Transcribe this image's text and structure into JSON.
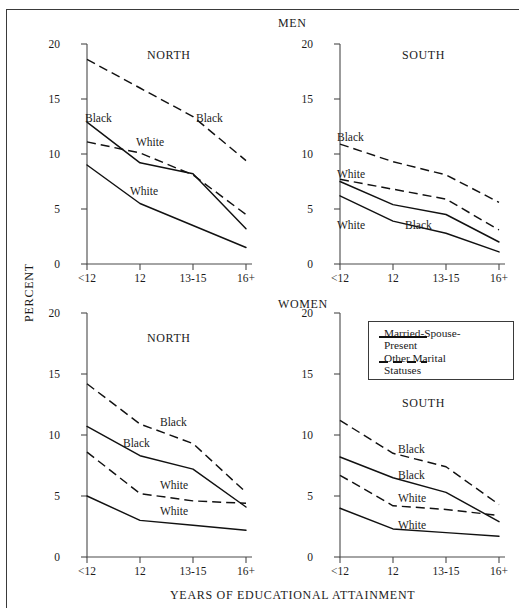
{
  "figure": {
    "xlabel": "YEARS OF EDUCATIONAL ATTAINMENT",
    "ylabel": "PERCENT",
    "group_men": "MEN",
    "group_women": "WOMEN"
  },
  "legend": {
    "title": "",
    "entries": [
      {
        "style": "solid",
        "line1": "Married-Spouse-",
        "line2": "Present"
      },
      {
        "style": "dashed",
        "line1": "Other Marital",
        "line2": "Statuses"
      }
    ]
  },
  "axes": {
    "y_ticks": [
      "0",
      "5",
      "10",
      "15",
      "20"
    ],
    "x_ticks": [
      "<12",
      "12",
      "13-15",
      "16+"
    ]
  },
  "panels": {
    "men_north": {
      "title": "NORTH",
      "labels": [
        "Black",
        "White",
        "Black",
        "White"
      ]
    },
    "men_south": {
      "title": "SOUTH",
      "labels": [
        "Black",
        "White",
        "White",
        "Black"
      ]
    },
    "women_north": {
      "title": "NORTH",
      "labels": [
        "Black",
        "Black",
        "White",
        "White"
      ]
    },
    "women_south": {
      "title": "SOUTH",
      "labels": [
        "Black",
        "Black",
        "White",
        "White"
      ]
    }
  },
  "chart_data": {
    "type": "line",
    "xlabel": "YEARS OF EDUCATIONAL ATTAINMENT",
    "ylabel": "PERCENT",
    "categories": [
      "<12",
      "12",
      "13-15",
      "16+"
    ],
    "ylim": [
      0,
      20
    ],
    "yticks": [
      0,
      5,
      10,
      15,
      20
    ],
    "grid": false,
    "legend_position": "inside-top-right-of-women-south-panel",
    "legend": [
      "Married-Spouse-Present",
      "Other Marital Statuses"
    ],
    "panels": [
      {
        "group": "MEN",
        "region": "NORTH",
        "series": [
          {
            "name": "Black, Other Marital Statuses",
            "race": "Black",
            "marital": "Other Marital Statuses",
            "style": "dashed",
            "values": [
              18.6,
              16.0,
              13.4,
              9.4
            ]
          },
          {
            "name": "Black, Married-Spouse-Present",
            "race": "Black",
            "marital": "Married-Spouse-Present",
            "style": "solid",
            "values": [
              12.9,
              9.2,
              8.2,
              3.2
            ]
          },
          {
            "name": "White, Other Marital Statuses",
            "race": "White",
            "marital": "Other Marital Statuses",
            "style": "dashed",
            "values": [
              11.1,
              10.1,
              8.1,
              4.5
            ]
          },
          {
            "name": "White, Married-Spouse-Present",
            "race": "White",
            "marital": "Married-Spouse-Present",
            "style": "solid",
            "values": [
              9.0,
              5.5,
              3.5,
              1.5
            ]
          }
        ]
      },
      {
        "group": "MEN",
        "region": "SOUTH",
        "series": [
          {
            "name": "Black, Other Marital Statuses",
            "race": "Black",
            "marital": "Other Marital Statuses",
            "style": "dashed",
            "values": [
              10.9,
              9.3,
              8.1,
              5.6
            ]
          },
          {
            "name": "White, Other Marital Statuses",
            "race": "White",
            "marital": "Other Marital Statuses",
            "style": "dashed",
            "values": [
              7.7,
              6.8,
              5.9,
              3.1
            ]
          },
          {
            "name": "Black, Married-Spouse-Present",
            "race": "Black",
            "marital": "Married-Spouse-Present",
            "style": "solid",
            "values": [
              7.5,
              5.4,
              4.5,
              2.0
            ]
          },
          {
            "name": "White, Married-Spouse-Present",
            "race": "White",
            "marital": "Married-Spouse-Present",
            "style": "solid",
            "values": [
              6.2,
              3.9,
              2.8,
              1.1
            ]
          }
        ]
      },
      {
        "group": "WOMEN",
        "region": "NORTH",
        "series": [
          {
            "name": "Black, Other Marital Statuses",
            "race": "Black",
            "marital": "Other Marital Statuses",
            "style": "dashed",
            "values": [
              14.2,
              10.9,
              9.3,
              5.3
            ]
          },
          {
            "name": "Black, Married-Spouse-Present",
            "race": "Black",
            "marital": "Married-Spouse-Present",
            "style": "solid",
            "values": [
              10.7,
              8.3,
              7.2,
              4.1
            ]
          },
          {
            "name": "White, Other Marital Statuses",
            "race": "White",
            "marital": "Other Marital Statuses",
            "style": "dashed",
            "values": [
              8.6,
              5.2,
              4.6,
              4.4
            ]
          },
          {
            "name": "White, Married-Spouse-Present",
            "race": "White",
            "marital": "Married-Spouse-Present",
            "style": "solid",
            "values": [
              5.0,
              3.0,
              2.6,
              2.2
            ]
          }
        ]
      },
      {
        "group": "WOMEN",
        "region": "SOUTH",
        "series": [
          {
            "name": "Black, Other Marital Statuses",
            "race": "Black",
            "marital": "Other Marital Statuses",
            "style": "dashed",
            "values": [
              11.2,
              8.5,
              7.4,
              4.3
            ]
          },
          {
            "name": "Black, Married-Spouse-Present",
            "race": "Black",
            "marital": "Married-Spouse-Present",
            "style": "solid",
            "values": [
              8.2,
              6.5,
              5.3,
              2.9
            ]
          },
          {
            "name": "White, Other Marital Statuses",
            "race": "White",
            "marital": "Other Marital Statuses",
            "style": "dashed",
            "values": [
              6.7,
              4.2,
              3.9,
              3.4
            ]
          },
          {
            "name": "White, Married-Spouse-Present",
            "race": "White",
            "marital": "Married-Spouse-Present",
            "style": "solid",
            "values": [
              4.0,
              2.3,
              2.0,
              1.7
            ]
          }
        ]
      }
    ]
  }
}
